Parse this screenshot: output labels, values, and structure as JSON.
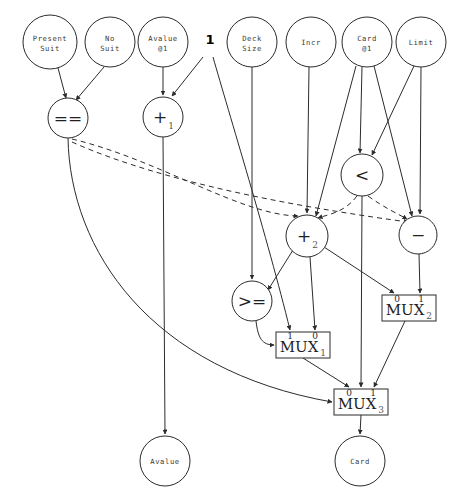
{
  "diagram": {
    "width": 460,
    "height": 503,
    "colors": {
      "stroke": "#2b2b2b",
      "background": "#ffffff",
      "label": "#3a3a3a"
    }
  },
  "inputs": [
    {
      "id": "present_suit",
      "label_line1": "Present",
      "label_line2": "Suit",
      "cx": 50,
      "cy": 42,
      "r": 27
    },
    {
      "id": "no_suit",
      "label_line1": "No",
      "label_line2": "Suit",
      "cx": 110,
      "cy": 42,
      "r": 25
    },
    {
      "id": "avalue_at1",
      "label_line1": "Avalue",
      "label_line2": "@1",
      "cx": 163,
      "cy": 42,
      "r": 25
    },
    {
      "id": "deck_size",
      "label_line1": "Deck",
      "label_line2": "Size",
      "cx": 252,
      "cy": 42,
      "r": 25
    },
    {
      "id": "incr",
      "label_line1": "Incr",
      "label_line2": "",
      "cx": 311,
      "cy": 42,
      "r": 25
    },
    {
      "id": "card_at1",
      "label_line1": "Card",
      "label_line2": "@1",
      "cx": 367,
      "cy": 42,
      "r": 25
    },
    {
      "id": "limit",
      "label_line1": "Limit",
      "label_line2": "",
      "cx": 421,
      "cy": 42,
      "r": 25
    }
  ],
  "constants": [
    {
      "id": "const_one",
      "label": "1",
      "x": 210,
      "y": 44
    }
  ],
  "operators": [
    {
      "id": "eq",
      "symbol": "==",
      "subscript": "",
      "cx": 68,
      "cy": 118,
      "r": 20
    },
    {
      "id": "plus1",
      "symbol": "+",
      "subscript": "1",
      "cx": 163,
      "cy": 117,
      "r": 20
    },
    {
      "id": "less",
      "symbol": "<",
      "subscript": "",
      "cx": 362,
      "cy": 175,
      "r": 21
    },
    {
      "id": "plus2",
      "symbol": "+",
      "subscript": "2",
      "cx": 307,
      "cy": 236,
      "r": 21
    },
    {
      "id": "minus",
      "symbol": "−",
      "subscript": "",
      "cx": 418,
      "cy": 235,
      "r": 19
    },
    {
      "id": "gte",
      "symbol": ">=",
      "subscript": "",
      "cx": 252,
      "cy": 301,
      "r": 20
    }
  ],
  "muxes": [
    {
      "id": "mux1",
      "label": "MUX",
      "subscript": "1",
      "x": 276,
      "y": 332,
      "width": 54,
      "height": 26,
      "ports": [
        {
          "label": "1",
          "x": 290,
          "y": 339
        },
        {
          "label": "0",
          "x": 315,
          "y": 339
        }
      ]
    },
    {
      "id": "mux2",
      "label": "MUX",
      "subscript": "2",
      "x": 382,
      "y": 295,
      "width": 54,
      "height": 26,
      "ports": [
        {
          "label": "0",
          "x": 397,
          "y": 302
        },
        {
          "label": "1",
          "x": 421,
          "y": 302
        }
      ]
    },
    {
      "id": "mux3",
      "label": "MUX",
      "subscript": "3",
      "x": 334,
      "y": 389,
      "width": 54,
      "height": 26,
      "ports": [
        {
          "label": "0",
          "x": 349,
          "y": 396
        },
        {
          "label": "1",
          "x": 373,
          "y": 396
        }
      ]
    }
  ],
  "outputs": [
    {
      "id": "out_avalue",
      "label": "Avalue",
      "cx": 165,
      "cy": 461,
      "r": 25
    },
    {
      "id": "out_card",
      "label": "Card",
      "cx": 360,
      "cy": 461,
      "r": 25
    }
  ],
  "edges": [
    {
      "id": "e_present_eq",
      "from": "present_suit",
      "to": "eq",
      "style": "solid",
      "d": "M 58,68 L 66,98"
    },
    {
      "id": "e_nosuit_eq",
      "from": "no_suit",
      "to": "eq",
      "style": "solid",
      "d": "M 104,67 L 76,100"
    },
    {
      "id": "e_avalue1_plus1",
      "from": "avalue_at1",
      "to": "plus1",
      "style": "solid",
      "d": "M 163,67 L 163,95"
    },
    {
      "id": "e_one_plus1",
      "from": "const_one",
      "to": "plus1",
      "style": "solid",
      "d": "M 203,57 L 172,96"
    },
    {
      "id": "e_one_mux1",
      "from": "const_one",
      "to": "mux1",
      "style": "solid",
      "d": "M 213,57 C 228,110 268,240 290,330"
    },
    {
      "id": "e_decksize_gte",
      "from": "deck_size",
      "to": "gte",
      "style": "solid",
      "d": "M 252,67 L 252,279"
    },
    {
      "id": "e_incr_plus2",
      "from": "incr",
      "to": "plus2",
      "style": "solid",
      "d": "M 309,67 L 307,213"
    },
    {
      "id": "e_card1_less_a",
      "from": "card_at1",
      "to": "less",
      "style": "solid",
      "d": "M 362,67 L 360,153"
    },
    {
      "id": "e_card1_plus2",
      "from": "card_at1",
      "to": "plus2",
      "style": "solid",
      "d": "M 356,66 L 316,216"
    },
    {
      "id": "e_card1_minus",
      "from": "card_at1",
      "to": "minus",
      "style": "solid",
      "d": "M 374,66 L 412,216"
    },
    {
      "id": "e_limit_less",
      "from": "limit",
      "to": "less",
      "style": "solid",
      "d": "M 414,66 L 372,155"
    },
    {
      "id": "e_limit_minus",
      "from": "limit",
      "to": "minus",
      "style": "solid",
      "d": "M 421,67 L 420,214"
    },
    {
      "id": "e_eq_mux3_sel",
      "from": "eq",
      "to": "mux3",
      "style": "solid",
      "d": "M 68,138 C 70,250 150,370 332,402"
    },
    {
      "id": "e_eq_plus2_dashed",
      "from": "eq",
      "to": "plus2",
      "style": "dashed",
      "d": "M 72,139 C 160,160 240,215 298,216"
    },
    {
      "id": "e_eq_minus_dashed",
      "from": "eq",
      "to": "minus",
      "style": "dashed",
      "d": "M 72,142 C 170,186 320,210 408,222"
    },
    {
      "id": "e_plus1_out_avalue",
      "from": "plus1",
      "to": "out_avalue",
      "style": "solid",
      "d": "M 163,137 L 165,434"
    },
    {
      "id": "e_less_plus2_dashed",
      "from": "less",
      "to": "plus2",
      "style": "dashed",
      "d": "M 357,196 C 345,212 330,214 318,218"
    },
    {
      "id": "e_less_minus_dashed",
      "from": "less",
      "to": "minus",
      "style": "dashed",
      "d": "M 368,196 C 385,208 398,214 407,219"
    },
    {
      "id": "e_less_mux3",
      "from": "less",
      "to": "mux3",
      "style": "solid",
      "d": "M 362,196 L 361,387"
    },
    {
      "id": "e_plus2_gte",
      "from": "plus2",
      "to": "gte",
      "style": "solid",
      "d": "M 293,250 L 268,290"
    },
    {
      "id": "e_plus2_mux1",
      "from": "plus2",
      "to": "mux1",
      "style": "solid",
      "d": "M 310,257 L 315,330"
    },
    {
      "id": "e_plus2_mux2",
      "from": "plus2",
      "to": "mux2",
      "style": "solid",
      "d": "M 324,247 L 394,293"
    },
    {
      "id": "e_minus_mux2",
      "from": "minus",
      "to": "mux2",
      "style": "solid",
      "d": "M 419,254 L 420,293"
    },
    {
      "id": "e_gte_mux1_sel",
      "from": "gte",
      "to": "mux1",
      "style": "solid",
      "d": "M 256,321 C 258,338 262,345 274,345"
    },
    {
      "id": "e_mux1_mux3",
      "from": "mux1",
      "to": "mux3",
      "style": "solid",
      "d": "M 303,358 L 349,387"
    },
    {
      "id": "e_mux2_mux3",
      "from": "mux2",
      "to": "mux3",
      "style": "solid",
      "d": "M 405,321 L 374,387"
    },
    {
      "id": "e_mux3_card",
      "from": "mux3",
      "to": "out_card",
      "style": "solid",
      "d": "M 361,415 L 360,434"
    }
  ]
}
